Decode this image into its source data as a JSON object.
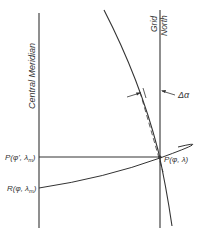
{
  "diagram": {
    "labels": {
      "central_meridian": "Central Meridian",
      "grid_north_1": "Grid",
      "grid_north_2": "North",
      "delta_alpha": "Δα",
      "point_p": "P(φ, λ)",
      "point_p_prime": "P(φ', λ",
      "point_p_prime_sub": "m",
      "point_p_prime_close": ")",
      "point_r": "R(φ, λ",
      "point_r_sub": "m",
      "point_r_close": ")"
    },
    "colors": {
      "line": "#333333",
      "background": "#ffffff"
    }
  }
}
